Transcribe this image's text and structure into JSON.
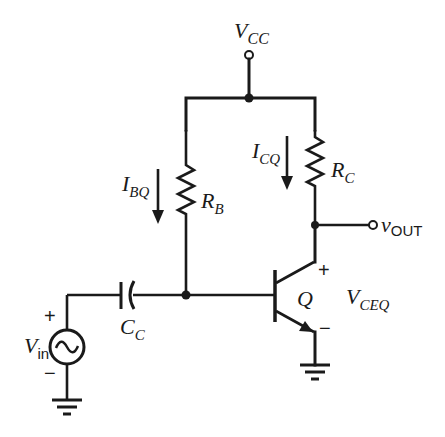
{
  "diagram": {
    "type": "common-emitter BJT amplifier bias circuit",
    "supply": {
      "label": "V",
      "subscript": "CC"
    },
    "base_resistor": {
      "label": "R",
      "subscript": "B"
    },
    "collector_resistor": {
      "label": "R",
      "subscript": "C"
    },
    "base_current": {
      "label": "I",
      "subscript": "BQ"
    },
    "collector_current": {
      "label": "I",
      "subscript": "CQ"
    },
    "output": {
      "label": "v",
      "subscript": "OUT"
    },
    "transistor": {
      "label": "Q"
    },
    "vce": {
      "label": "V",
      "subscript": "CEQ",
      "plus": "+",
      "minus": "−"
    },
    "coupling_capacitor": {
      "label": "C",
      "subscript": "C"
    },
    "input_source": {
      "label": "V",
      "subscript": "in",
      "plus": "+",
      "minus": "−"
    }
  }
}
